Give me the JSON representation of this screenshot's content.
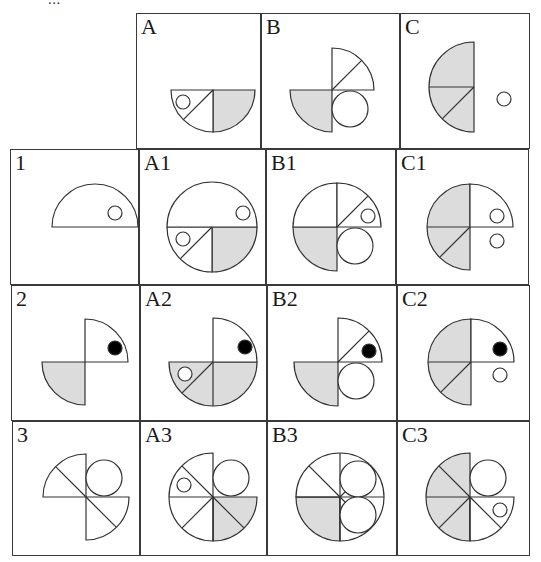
{
  "page": {
    "header_text_cut": "...",
    "shade_color": "#dcdcdc",
    "stroke_color": "#333333"
  },
  "grid": {
    "columns": [
      "",
      "A",
      "B",
      "C"
    ],
    "rows": [
      "",
      "1",
      "2",
      "3"
    ],
    "cells": [
      {
        "id": "A",
        "label": "A",
        "x": 136,
        "y": 13,
        "w": 125,
        "h": 136,
        "shapes": [
          {
            "type": "sector",
            "cx": 76,
            "cy": 76,
            "r": 42,
            "a0": 0,
            "a1": 90,
            "fill": true
          },
          {
            "type": "sector",
            "cx": 76,
            "cy": 76,
            "r": 42,
            "a0": 90,
            "a1": 180,
            "fill": false
          },
          {
            "type": "ray",
            "cx": 76,
            "cy": 76,
            "r": 42,
            "a": 135
          },
          {
            "type": "circle",
            "cx": 46,
            "cy": 88,
            "r": 7,
            "fill": "none"
          }
        ]
      },
      {
        "id": "B",
        "label": "B",
        "x": 261,
        "y": 13,
        "w": 139,
        "h": 136,
        "shapes": [
          {
            "type": "sector",
            "cx": 70,
            "cy": 76,
            "r": 42,
            "a0": 90,
            "a1": 180,
            "fill": true
          },
          {
            "type": "sector",
            "cx": 70,
            "cy": 76,
            "r": 42,
            "a0": 270,
            "a1": 360,
            "fill": false
          },
          {
            "type": "ray",
            "cx": 70,
            "cy": 76,
            "r": 42,
            "a": 315
          },
          {
            "type": "circle",
            "cx": 88,
            "cy": 95,
            "r": 18,
            "fill": "none"
          }
        ]
      },
      {
        "id": "C",
        "label": "C",
        "x": 400,
        "y": 13,
        "w": 130,
        "h": 136,
        "shapes": [
          {
            "type": "sector",
            "cx": 73,
            "cy": 73,
            "r": 45,
            "a0": 90,
            "a1": 270,
            "fill": true
          },
          {
            "type": "ray",
            "cx": 73,
            "cy": 73,
            "r": 45,
            "a": 180
          },
          {
            "type": "ray",
            "cx": 73,
            "cy": 73,
            "r": 45,
            "a": 135
          },
          {
            "type": "circle",
            "cx": 103,
            "cy": 85,
            "r": 7,
            "fill": "none"
          }
        ]
      },
      {
        "id": "1",
        "label": "1",
        "x": 10,
        "y": 149,
        "w": 129,
        "h": 136,
        "shapes": [
          {
            "type": "sector",
            "cx": 84,
            "cy": 77,
            "r": 43,
            "a0": 180,
            "a1": 360,
            "fill": false
          },
          {
            "type": "circle",
            "cx": 104,
            "cy": 63,
            "r": 7,
            "fill": "none"
          }
        ]
      },
      {
        "id": "A1",
        "label": "A1",
        "x": 139,
        "y": 149,
        "w": 127,
        "h": 136,
        "shapes": [
          {
            "type": "sector",
            "cx": 72,
            "cy": 77,
            "r": 45,
            "a0": 0,
            "a1": 90,
            "fill": true
          },
          {
            "type": "sector",
            "cx": 72,
            "cy": 77,
            "r": 45,
            "a0": 90,
            "a1": 180,
            "fill": false
          },
          {
            "type": "sector",
            "cx": 72,
            "cy": 77,
            "r": 45,
            "a0": 180,
            "a1": 360,
            "fill": false
          },
          {
            "type": "ray",
            "cx": 72,
            "cy": 77,
            "r": 45,
            "a": 135
          },
          {
            "type": "circle",
            "cx": 103,
            "cy": 63,
            "r": 7,
            "fill": "none"
          },
          {
            "type": "circle",
            "cx": 43,
            "cy": 89,
            "r": 7,
            "fill": "none"
          }
        ]
      },
      {
        "id": "B1",
        "label": "B1",
        "x": 266,
        "y": 149,
        "w": 130,
        "h": 136,
        "shapes": [
          {
            "type": "sector",
            "cx": 70,
            "cy": 77,
            "r": 44,
            "a0": 90,
            "a1": 180,
            "fill": true
          },
          {
            "type": "sector",
            "cx": 70,
            "cy": 77,
            "r": 44,
            "a0": 180,
            "a1": 270,
            "fill": false
          },
          {
            "type": "sector",
            "cx": 70,
            "cy": 77,
            "r": 44,
            "a0": 270,
            "a1": 360,
            "fill": false
          },
          {
            "type": "ray",
            "cx": 70,
            "cy": 77,
            "r": 44,
            "a": 315
          },
          {
            "type": "circle",
            "cx": 101,
            "cy": 66,
            "r": 7,
            "fill": "none"
          },
          {
            "type": "circle",
            "cx": 88,
            "cy": 96,
            "r": 18,
            "fill": "none"
          }
        ]
      },
      {
        "id": "C1",
        "label": "C1",
        "x": 396,
        "y": 149,
        "w": 133,
        "h": 136,
        "shapes": [
          {
            "type": "sector",
            "cx": 73,
            "cy": 77,
            "r": 43,
            "a0": 90,
            "a1": 270,
            "fill": true
          },
          {
            "type": "sector",
            "cx": 73,
            "cy": 77,
            "r": 43,
            "a0": 270,
            "a1": 360,
            "fill": false
          },
          {
            "type": "ray",
            "cx": 73,
            "cy": 77,
            "r": 43,
            "a": 180
          },
          {
            "type": "ray",
            "cx": 73,
            "cy": 77,
            "r": 43,
            "a": 135
          },
          {
            "type": "circle",
            "cx": 100,
            "cy": 66,
            "r": 7,
            "fill": "none"
          },
          {
            "type": "circle",
            "cx": 100,
            "cy": 91,
            "r": 7,
            "fill": "none"
          }
        ]
      },
      {
        "id": "2",
        "label": "2",
        "x": 11,
        "y": 285,
        "w": 129,
        "h": 136,
        "shapes": [
          {
            "type": "sector",
            "cx": 73,
            "cy": 76,
            "r": 43,
            "a0": 90,
            "a1": 180,
            "fill": true
          },
          {
            "type": "sector",
            "cx": 73,
            "cy": 76,
            "r": 43,
            "a0": 270,
            "a1": 360,
            "fill": false
          },
          {
            "type": "circle",
            "cx": 103,
            "cy": 62,
            "r": 7,
            "fill": "black"
          }
        ]
      },
      {
        "id": "A2",
        "label": "A2",
        "x": 140,
        "y": 285,
        "w": 127,
        "h": 136,
        "shapes": [
          {
            "type": "sector",
            "cx": 72,
            "cy": 76,
            "r": 44,
            "a0": 0,
            "a1": 180,
            "fill": true
          },
          {
            "type": "sector",
            "cx": 72,
            "cy": 76,
            "r": 44,
            "a0": 270,
            "a1": 360,
            "fill": false
          },
          {
            "type": "ray",
            "cx": 72,
            "cy": 76,
            "r": 44,
            "a": 90
          },
          {
            "type": "ray",
            "cx": 72,
            "cy": 76,
            "r": 44,
            "a": 135
          },
          {
            "type": "circle",
            "cx": 104,
            "cy": 61,
            "r": 7,
            "fill": "black"
          },
          {
            "type": "circle",
            "cx": 44,
            "cy": 88,
            "r": 7,
            "fill": "none"
          }
        ]
      },
      {
        "id": "B2",
        "label": "B2",
        "x": 267,
        "y": 285,
        "w": 130,
        "h": 136,
        "shapes": [
          {
            "type": "sector",
            "cx": 70,
            "cy": 76,
            "r": 44,
            "a0": 90,
            "a1": 180,
            "fill": true
          },
          {
            "type": "sector",
            "cx": 70,
            "cy": 76,
            "r": 44,
            "a0": 270,
            "a1": 360,
            "fill": false
          },
          {
            "type": "ray",
            "cx": 70,
            "cy": 76,
            "r": 44,
            "a": 315
          },
          {
            "type": "circle",
            "cx": 101,
            "cy": 65,
            "r": 7,
            "fill": "black"
          },
          {
            "type": "circle",
            "cx": 88,
            "cy": 95,
            "r": 18,
            "fill": "none"
          }
        ]
      },
      {
        "id": "C2",
        "label": "C2",
        "x": 397,
        "y": 285,
        "w": 133,
        "h": 136,
        "shapes": [
          {
            "type": "sector",
            "cx": 73,
            "cy": 76,
            "r": 43,
            "a0": 90,
            "a1": 270,
            "fill": true
          },
          {
            "type": "sector",
            "cx": 73,
            "cy": 76,
            "r": 43,
            "a0": 270,
            "a1": 360,
            "fill": false
          },
          {
            "type": "ray",
            "cx": 73,
            "cy": 76,
            "r": 43,
            "a": 180
          },
          {
            "type": "ray",
            "cx": 73,
            "cy": 76,
            "r": 43,
            "a": 135
          },
          {
            "type": "circle",
            "cx": 102,
            "cy": 63,
            "r": 7,
            "fill": "black"
          },
          {
            "type": "circle",
            "cx": 102,
            "cy": 89,
            "r": 7,
            "fill": "none"
          }
        ]
      },
      {
        "id": "3",
        "label": "3",
        "x": 12,
        "y": 421,
        "w": 128,
        "h": 135,
        "shapes": [
          {
            "type": "sector",
            "cx": 73,
            "cy": 75,
            "r": 43,
            "a0": 180,
            "a1": 270,
            "fill": false
          },
          {
            "type": "sector",
            "cx": 73,
            "cy": 75,
            "r": 43,
            "a0": 0,
            "a1": 90,
            "fill": false
          },
          {
            "type": "ray",
            "cx": 73,
            "cy": 75,
            "r": 43,
            "a": 225
          },
          {
            "type": "ray",
            "cx": 73,
            "cy": 75,
            "r": 43,
            "a": 45
          },
          {
            "type": "circle",
            "cx": 91,
            "cy": 56,
            "r": 18,
            "fill": "none"
          }
        ]
      },
      {
        "id": "A3",
        "label": "A3",
        "x": 140,
        "y": 421,
        "w": 127,
        "h": 135,
        "shapes": [
          {
            "type": "sector",
            "cx": 72,
            "cy": 75,
            "r": 44,
            "a0": 0,
            "a1": 90,
            "fill": true
          },
          {
            "type": "sector",
            "cx": 72,
            "cy": 75,
            "r": 44,
            "a0": 90,
            "a1": 270,
            "fill": false
          },
          {
            "type": "ray",
            "cx": 72,
            "cy": 75,
            "r": 44,
            "a": 180
          },
          {
            "type": "ray",
            "cx": 72,
            "cy": 75,
            "r": 44,
            "a": 90
          },
          {
            "type": "ray",
            "cx": 72,
            "cy": 75,
            "r": 44,
            "a": 45
          },
          {
            "type": "ray",
            "cx": 72,
            "cy": 75,
            "r": 44,
            "a": 135
          },
          {
            "type": "ray",
            "cx": 72,
            "cy": 75,
            "r": 44,
            "a": 225
          },
          {
            "type": "circle",
            "cx": 90,
            "cy": 56,
            "r": 18,
            "fill": "none"
          },
          {
            "type": "circle",
            "cx": 43,
            "cy": 63,
            "r": 7,
            "fill": "none"
          }
        ]
      },
      {
        "id": "B3",
        "label": "B3",
        "x": 267,
        "y": 421,
        "w": 130,
        "h": 135,
        "shapes": [
          {
            "type": "sector",
            "cx": 72,
            "cy": 75,
            "r": 44,
            "a0": 90,
            "a1": 180,
            "fill": true
          },
          {
            "type": "sector",
            "cx": 72,
            "cy": 75,
            "r": 44,
            "a0": 180,
            "a1": 450,
            "fill": false
          },
          {
            "type": "ray",
            "cx": 72,
            "cy": 75,
            "r": 44,
            "a": 0
          },
          {
            "type": "ray",
            "cx": 72,
            "cy": 75,
            "r": 44,
            "a": 90
          },
          {
            "type": "ray",
            "cx": 72,
            "cy": 75,
            "r": 44,
            "a": 180
          },
          {
            "type": "ray",
            "cx": 72,
            "cy": 75,
            "r": 44,
            "a": 270
          },
          {
            "type": "ray",
            "cx": 72,
            "cy": 75,
            "r": 44,
            "a": 45
          },
          {
            "type": "ray",
            "cx": 72,
            "cy": 75,
            "r": 44,
            "a": 225
          },
          {
            "type": "ray",
            "cx": 72,
            "cy": 75,
            "r": 44,
            "a": 315
          },
          {
            "type": "circle",
            "cx": 90,
            "cy": 57,
            "r": 18,
            "fill": "none"
          },
          {
            "type": "circle",
            "cx": 90,
            "cy": 93,
            "r": 18,
            "fill": "none"
          }
        ]
      },
      {
        "id": "C3",
        "label": "C3",
        "x": 397,
        "y": 421,
        "w": 133,
        "h": 135,
        "shapes": [
          {
            "type": "sector",
            "cx": 72,
            "cy": 75,
            "r": 44,
            "a0": 90,
            "a1": 270,
            "fill": true
          },
          {
            "type": "sector",
            "cx": 72,
            "cy": 75,
            "r": 44,
            "a0": 0,
            "a1": 90,
            "fill": false
          },
          {
            "type": "ray",
            "cx": 72,
            "cy": 75,
            "r": 44,
            "a": 180
          },
          {
            "type": "ray",
            "cx": 72,
            "cy": 75,
            "r": 44,
            "a": 135
          },
          {
            "type": "ray",
            "cx": 72,
            "cy": 75,
            "r": 44,
            "a": 225
          },
          {
            "type": "ray",
            "cx": 72,
            "cy": 75,
            "r": 44,
            "a": 45
          },
          {
            "type": "ray",
            "cx": 72,
            "cy": 75,
            "r": 44,
            "a": 90
          },
          {
            "type": "circle",
            "cx": 90,
            "cy": 56,
            "r": 18,
            "fill": "none"
          },
          {
            "type": "circle",
            "cx": 102,
            "cy": 88,
            "r": 7,
            "fill": "none"
          }
        ]
      }
    ]
  }
}
